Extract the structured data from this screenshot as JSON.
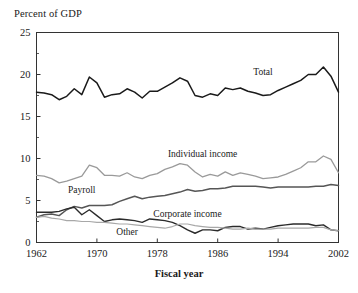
{
  "chart_data": {
    "type": "line",
    "title": "",
    "ylabel": "Percent of GDP",
    "xlabel": "Fiscal year",
    "xlim": [
      1962,
      2002
    ],
    "ylim": [
      0,
      25
    ],
    "yticks": [
      0,
      5,
      10,
      15,
      20,
      25
    ],
    "ytick_labels": [
      "0",
      "5",
      "10",
      "15",
      "20",
      "25"
    ],
    "xticks": [
      1962,
      1970,
      1978,
      1986,
      1994,
      2002
    ],
    "xtick_labels": [
      "1962",
      "1970",
      "1978",
      "1986",
      "1994",
      "2002"
    ],
    "grid": false,
    "legend": "inline-annotations",
    "x": [
      1962,
      1963,
      1964,
      1965,
      1966,
      1967,
      1968,
      1969,
      1970,
      1971,
      1972,
      1973,
      1974,
      1975,
      1976,
      1977,
      1978,
      1979,
      1980,
      1981,
      1982,
      1983,
      1984,
      1985,
      1986,
      1987,
      1988,
      1989,
      1990,
      1991,
      1992,
      1993,
      1994,
      1995,
      1996,
      1997,
      1998,
      1999,
      2000,
      2001,
      2002
    ],
    "series": [
      {
        "name": "Total",
        "color": "#1a1a1a",
        "width": 1.5,
        "label_x": 1992,
        "label_y": 20.0,
        "values": [
          17.9,
          17.8,
          17.6,
          17.0,
          17.4,
          18.3,
          17.6,
          19.7,
          19.0,
          17.3,
          17.6,
          17.7,
          18.3,
          17.9,
          17.2,
          18.0,
          18.0,
          18.5,
          19.0,
          19.6,
          19.2,
          17.5,
          17.3,
          17.7,
          17.5,
          18.4,
          18.2,
          18.4,
          18.0,
          17.8,
          17.5,
          17.6,
          18.1,
          18.5,
          18.9,
          19.3,
          20.0,
          20.0,
          20.9,
          19.8,
          17.9
        ]
      },
      {
        "name": "Individual income",
        "color": "#9a9a9a",
        "width": 1.3,
        "label_x": 1984,
        "label_y": 10.2,
        "values": [
          8.0,
          7.9,
          7.6,
          7.1,
          7.3,
          7.6,
          7.9,
          9.2,
          8.9,
          8.0,
          8.0,
          7.9,
          8.3,
          7.8,
          7.6,
          8.0,
          8.2,
          8.7,
          9.0,
          9.4,
          9.2,
          8.4,
          7.8,
          8.1,
          7.9,
          8.4,
          8.0,
          8.3,
          8.1,
          7.9,
          7.6,
          7.7,
          7.8,
          8.1,
          8.5,
          8.9,
          9.6,
          9.6,
          10.3,
          9.9,
          8.3
        ]
      },
      {
        "name": "Payroll",
        "color": "#565656",
        "width": 1.5,
        "label_x": 1968,
        "label_y": 5.9,
        "values": [
          3.0,
          3.3,
          3.4,
          3.2,
          3.9,
          4.3,
          4.1,
          4.4,
          4.4,
          4.4,
          4.5,
          4.9,
          5.2,
          5.5,
          5.2,
          5.4,
          5.5,
          5.6,
          5.8,
          6.0,
          6.3,
          6.1,
          6.2,
          6.4,
          6.4,
          6.5,
          6.7,
          6.7,
          6.7,
          6.7,
          6.6,
          6.5,
          6.6,
          6.6,
          6.6,
          6.6,
          6.6,
          6.7,
          6.7,
          6.9,
          6.8
        ]
      },
      {
        "name": "Corporate income",
        "color": "#2b2b2b",
        "width": 1.4,
        "label_x": 1982,
        "label_y": 3.0,
        "values": [
          3.6,
          3.6,
          3.6,
          3.7,
          4.0,
          4.2,
          3.3,
          3.9,
          3.2,
          2.5,
          2.7,
          2.8,
          2.7,
          2.6,
          2.4,
          2.8,
          2.7,
          2.6,
          2.4,
          2.0,
          1.5,
          1.1,
          1.5,
          1.5,
          1.4,
          1.8,
          1.9,
          1.9,
          1.6,
          1.7,
          1.6,
          1.8,
          2.0,
          2.1,
          2.2,
          2.2,
          2.2,
          2.0,
          2.1,
          1.5,
          1.4
        ]
      },
      {
        "name": "Other",
        "color": "#a8a8a8",
        "width": 1.2,
        "label_x": 1974,
        "label_y": 0.9,
        "values": [
          3.0,
          3.1,
          2.9,
          2.8,
          2.6,
          2.6,
          2.5,
          2.5,
          2.4,
          2.4,
          2.3,
          2.2,
          2.2,
          2.1,
          2.0,
          1.9,
          1.8,
          1.7,
          1.9,
          2.2,
          2.2,
          2.0,
          1.9,
          1.8,
          1.8,
          1.7,
          1.6,
          1.6,
          1.7,
          1.6,
          1.6,
          1.6,
          1.7,
          1.7,
          1.7,
          1.7,
          1.7,
          1.8,
          1.8,
          1.5,
          1.4
        ]
      }
    ]
  },
  "axis": {
    "frame_color": "#333333"
  }
}
